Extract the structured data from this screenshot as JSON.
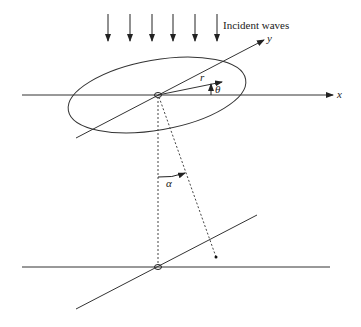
{
  "diagram": {
    "labels": {
      "incident_waves": "Incident waves",
      "x_axis": "x",
      "y_axis": "y",
      "r": "r",
      "theta": "θ",
      "alpha": "α"
    },
    "colors": {
      "line": "#333333",
      "background": "#ffffff"
    },
    "incident_arrows": {
      "count": 6,
      "x_positions": [
        108,
        130,
        152,
        173,
        195,
        217
      ]
    }
  }
}
